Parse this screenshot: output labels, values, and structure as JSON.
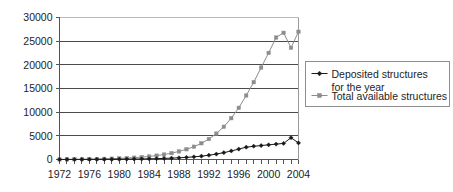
{
  "chart_data": {
    "type": "line",
    "title": "",
    "subtitle": "",
    "xlabel": "",
    "ylabel": "",
    "xlim": [
      1972,
      2004
    ],
    "ylim": [
      0,
      30000
    ],
    "grid": true,
    "grid_axis": "y",
    "legend_position": "right",
    "x": [
      1972,
      1973,
      1974,
      1975,
      1976,
      1977,
      1978,
      1979,
      1980,
      1981,
      1982,
      1983,
      1984,
      1985,
      1986,
      1987,
      1988,
      1989,
      1990,
      1991,
      1992,
      1993,
      1994,
      1995,
      1996,
      1997,
      1998,
      1999,
      2000,
      2001,
      2002,
      2003,
      2004
    ],
    "x_tick_labels": [
      "1972",
      "1976",
      "1980",
      "1984",
      "1988",
      "1992",
      "1996",
      "2000",
      "2004"
    ],
    "x_tick_values": [
      1972,
      1976,
      1980,
      1984,
      1988,
      1992,
      1996,
      2000,
      2004
    ],
    "y_tick_labels": [
      "0",
      "5000",
      "10000",
      "15000",
      "20000",
      "25000",
      "30000"
    ],
    "y_tick_values": [
      0,
      5000,
      10000,
      15000,
      20000,
      25000,
      30000
    ],
    "series": [
      {
        "name": "Deposited structures for the year",
        "marker": "diamond",
        "color": "#1a1a1a",
        "values": [
          10,
          12,
          15,
          18,
          22,
          28,
          35,
          45,
          55,
          68,
          85,
          110,
          140,
          180,
          230,
          290,
          360,
          450,
          560,
          710,
          900,
          1150,
          1450,
          1800,
          2200,
          2600,
          2800,
          2950,
          3100,
          3250,
          3400,
          4600,
          3500
        ]
      },
      {
        "name": "Total available structures",
        "marker": "square",
        "color": "#8c8c8c",
        "values": [
          10,
          22,
          37,
          55,
          77,
          105,
          140,
          185,
          240,
          308,
          393,
          503,
          643,
          823,
          1053,
          1343,
          1703,
          2153,
          2713,
          3423,
          4323,
          5473,
          6923,
          8723,
          10923,
          13523,
          16323,
          19423,
          22523,
          25773,
          26773,
          23600,
          27000
        ]
      }
    ],
    "legend_entries": [
      {
        "label_line1": "Deposited structures",
        "label_line2": "for the year",
        "marker": "diamond",
        "color": "#1a1a1a"
      },
      {
        "label_line1": "Total available structures",
        "label_line2": "",
        "marker": "square",
        "color": "#8c8c8c"
      }
    ]
  },
  "colors": {
    "series_deposited": "#1a1a1a",
    "series_total": "#8c8c8c",
    "gridline": "#4a4a4a",
    "axis": "#555555",
    "legend_border": "#8d8d8d",
    "background": "#ffffff"
  },
  "legend": {
    "entry_1_line_1": "Deposited structures",
    "entry_1_line_2": "for the year",
    "entry_2_line_1": "Total available structures"
  }
}
